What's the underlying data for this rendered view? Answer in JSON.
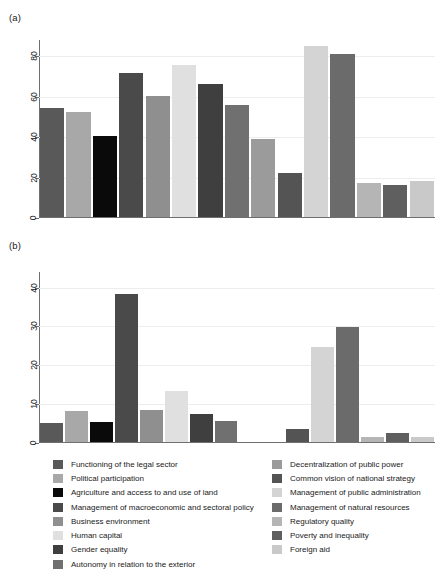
{
  "figure": {
    "panel_a_label": "(a)",
    "panel_b_label": "(b)"
  },
  "chart_data": [
    {
      "type": "bar",
      "title": "(a)",
      "xlabel": "",
      "ylabel": "",
      "ylim": [
        0,
        88
      ],
      "yticks": [
        0,
        20,
        40,
        60,
        80
      ],
      "ytick_labels": [
        "0",
        "20",
        "40",
        "60",
        "80"
      ],
      "grid": true,
      "legend_position": "bottom",
      "categories": [
        "Functioning of the legal sector",
        "Political participation",
        "Agriculture and access to and use of land",
        "Management of macroeconomic and sectoral policy",
        "Business environment",
        "Human capital",
        "Gender equality",
        "Autonomy in relation to the exterior",
        "Decentralization of public power",
        "Common vision of national strategy",
        "Management of public administration",
        "Management of natural resources",
        "Regulatory quality",
        "Poverty and inequality",
        "Foreign aid"
      ],
      "values": [
        54,
        52,
        40,
        71,
        60,
        75,
        66,
        55.5,
        38.5,
        22,
        84.5,
        80.5,
        17,
        16,
        18
      ]
    },
    {
      "type": "bar",
      "title": "(b)",
      "xlabel": "",
      "ylabel": "",
      "ylim": [
        0,
        44
      ],
      "yticks": [
        0,
        10,
        20,
        30,
        40
      ],
      "ytick_labels": [
        "0",
        "10",
        "20",
        "30",
        "40"
      ],
      "grid": true,
      "legend_position": "bottom",
      "categories": [
        "Functioning of the legal sector",
        "Political participation",
        "Agriculture and access to and use of land",
        "Management of macroeconomic and sectoral policy",
        "Business environment",
        "Human capital",
        "Gender equality",
        "Autonomy in relation to the exterior",
        "Decentralization of public power",
        "Common vision of national strategy",
        "Management of public administration",
        "Management of natural resources",
        "Regulatory quality",
        "Poverty and inequality",
        "Foreign aid"
      ],
      "values": [
        5,
        8,
        5.2,
        38,
        8.2,
        13,
        7.2,
        5.3,
        0,
        3.3,
        24.4,
        29.5,
        1.3,
        2.3,
        1.3
      ]
    }
  ],
  "series_colors": [
    "#595959",
    "#a8a8a8",
    "#0a0a0a",
    "#4a4a4a",
    "#8f8f8f",
    "#e0e0e0",
    "#3f3f3f",
    "#707070",
    "#9b9b9b",
    "#545454",
    "#d4d4d4",
    "#6b6b6b",
    "#b5b5b5",
    "#5f5f5f",
    "#c9c9c9"
  ],
  "legend": {
    "left_column": [
      {
        "label": "Functioning of the legal sector",
        "color": "#595959",
        "index": 0
      },
      {
        "label": "Political participation",
        "color": "#a8a8a8",
        "index": 1
      },
      {
        "label": "Agriculture and access to and use of land",
        "color": "#0a0a0a",
        "index": 2
      },
      {
        "label": "Management of macroeconomic and sectoral policy",
        "color": "#4a4a4a",
        "index": 3
      },
      {
        "label": "Business environment",
        "color": "#8f8f8f",
        "index": 4
      },
      {
        "label": "Human capital",
        "color": "#e0e0e0",
        "index": 5
      },
      {
        "label": "Gender equality",
        "color": "#3f3f3f",
        "index": 6
      },
      {
        "label": "Autonomy in relation to the exterior",
        "color": "#707070",
        "index": 7
      }
    ],
    "right_column": [
      {
        "label": "Decentralization of public power",
        "color": "#9b9b9b",
        "index": 8
      },
      {
        "label": "Common vision of national strategy",
        "color": "#545454",
        "index": 9
      },
      {
        "label": "Management of public administration",
        "color": "#d4d4d4",
        "index": 10
      },
      {
        "label": "Management of natural resources",
        "color": "#6b6b6b",
        "index": 11
      },
      {
        "label": "Regulatory quality",
        "color": "#b5b5b5",
        "index": 12
      },
      {
        "label": "Poverty and inequality",
        "color": "#5f5f5f",
        "index": 13
      },
      {
        "label": "Foreign aid",
        "color": "#c9c9c9",
        "index": 14
      }
    ]
  },
  "style": {
    "axis_color": "#6f6f6f",
    "grid_color": "#ededed",
    "text_color": "#1a1a1a",
    "background": "#ffffff"
  }
}
